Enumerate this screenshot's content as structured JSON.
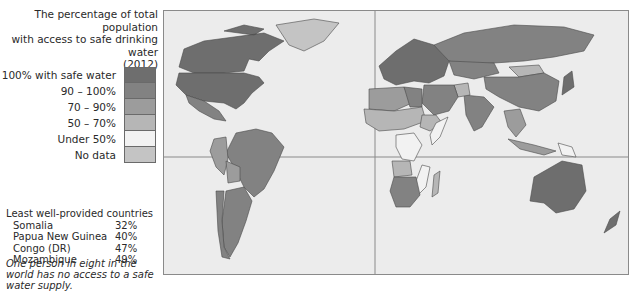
{
  "title": {
    "line1": "The percentage of total population",
    "line2": "with access to safe drinking water",
    "line3": "(2012)"
  },
  "legend": {
    "items": [
      {
        "label": "100% with safe water",
        "color": "#6e6e6e"
      },
      {
        "label": "90 – 100%",
        "color": "#828282"
      },
      {
        "label": "70 – 90%",
        "color": "#9c9c9c"
      },
      {
        "label": "50 – 70%",
        "color": "#b6b6b6"
      },
      {
        "label": "Under 50%",
        "color": "#f2f2f2"
      },
      {
        "label": "No data",
        "color": "#c4c4c4"
      }
    ]
  },
  "least_provided": {
    "heading": "Least well-provided countries",
    "rows": [
      {
        "country": "Somalia",
        "value": "32%"
      },
      {
        "country": "Papua New Guinea",
        "value": "40%"
      },
      {
        "country": "Congo (DR)",
        "value": "47%"
      },
      {
        "country": "Mozambique",
        "value": "49%"
      }
    ]
  },
  "note": "One person in eight in the world has no access to a safe water supply.",
  "map": {
    "ocean_color": "#ececec",
    "border_color": "#4a4a4a",
    "regions": [
      {
        "name": "Canada",
        "category": "100% with safe water"
      },
      {
        "name": "USA",
        "category": "100% with safe water"
      },
      {
        "name": "Greenland",
        "category": "No data"
      },
      {
        "name": "Mexico",
        "category": "90 – 100%"
      },
      {
        "name": "Brazil",
        "category": "90 – 100%"
      },
      {
        "name": "Argentina",
        "category": "90 – 100%"
      },
      {
        "name": "Chile",
        "category": "90 – 100%"
      },
      {
        "name": "Peru",
        "category": "70 – 90%"
      },
      {
        "name": "Bolivia",
        "category": "70 – 90%"
      },
      {
        "name": "Europe",
        "category": "100% with safe water"
      },
      {
        "name": "Russia",
        "category": "90 – 100%"
      },
      {
        "name": "Kazakhstan",
        "category": "90 – 100%"
      },
      {
        "name": "Mongolia",
        "category": "50 – 70%"
      },
      {
        "name": "China",
        "category": "90 – 100%"
      },
      {
        "name": "India",
        "category": "90 – 100%"
      },
      {
        "name": "Afghanistan",
        "category": "50 – 70%"
      },
      {
        "name": "Middle East",
        "category": "90 – 100%"
      },
      {
        "name": "North Africa",
        "category": "70 – 90%"
      },
      {
        "name": "Egypt",
        "category": "90 – 100%"
      },
      {
        "name": "Sahel & West Africa",
        "category": "50 – 70%"
      },
      {
        "name": "Ethiopia",
        "category": "50 – 70%"
      },
      {
        "name": "Somalia",
        "category": "Under 50%"
      },
      {
        "name": "Congo (DR)",
        "category": "Under 50%"
      },
      {
        "name": "Angola",
        "category": "50 – 70%"
      },
      {
        "name": "Mozambique",
        "category": "Under 50%"
      },
      {
        "name": "Southern Africa",
        "category": "90 – 100%"
      },
      {
        "name": "Madagascar",
        "category": "50 – 70%"
      },
      {
        "name": "Southeast Asia",
        "category": "70 – 90%"
      },
      {
        "name": "Indonesia",
        "category": "70 – 90%"
      },
      {
        "name": "Papua New Guinea",
        "category": "Under 50%"
      },
      {
        "name": "Japan",
        "category": "100% with safe water"
      },
      {
        "name": "Australia",
        "category": "100% with safe water"
      },
      {
        "name": "New Zealand",
        "category": "100% with safe water"
      }
    ]
  }
}
